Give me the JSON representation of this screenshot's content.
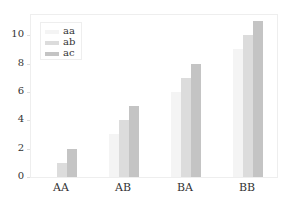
{
  "chart_data": {
    "type": "bar",
    "title": "",
    "xlabel": "",
    "ylabel": "",
    "categories": [
      "AA",
      "AB",
      "BA",
      "BB"
    ],
    "series": [
      {
        "name": "aa",
        "values": [
          0,
          3,
          6,
          9
        ],
        "color": "#f4f4f4"
      },
      {
        "name": "ab",
        "values": [
          1,
          4,
          7,
          10
        ],
        "color": "#dcdcdc"
      },
      {
        "name": "ac",
        "values": [
          2,
          5,
          8,
          11
        ],
        "color": "#c4c4c4"
      }
    ],
    "yticks": [
      0,
      2,
      4,
      6,
      8,
      10
    ],
    "ylim": [
      0,
      11.5
    ],
    "grid": false,
    "legend_position": "upper left"
  }
}
